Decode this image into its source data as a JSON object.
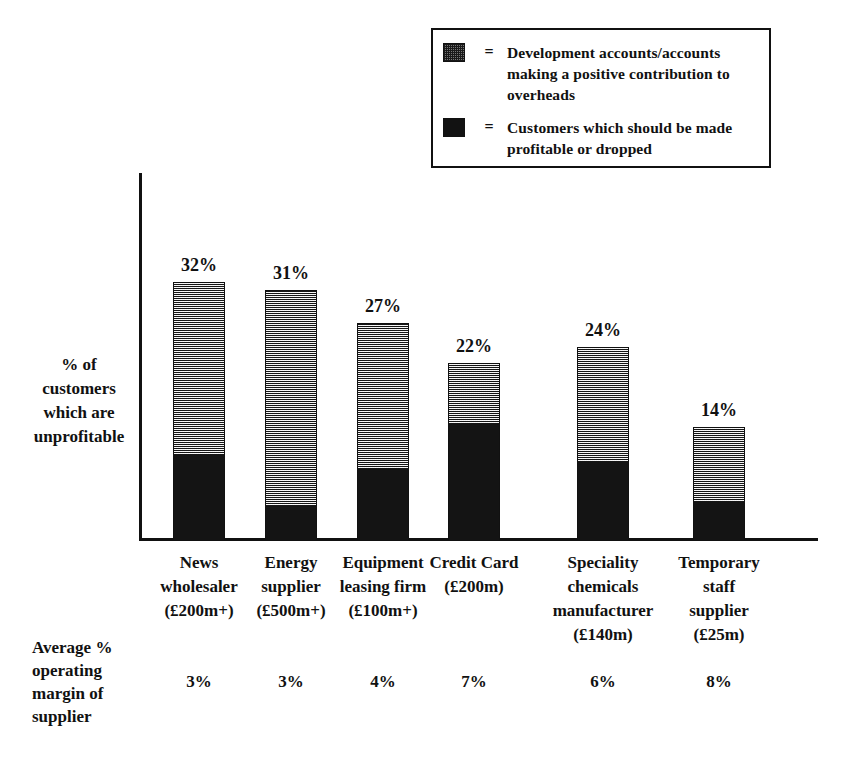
{
  "legend": {
    "items": [
      {
        "swatch": "stipple-pattern-swatch",
        "equals": "=",
        "label": "Development accounts/accounts making a positive contribution to overheads"
      },
      {
        "swatch": "solid-black-swatch",
        "equals": "=",
        "label": "Customers which should be made profitable or dropped"
      }
    ]
  },
  "axes": {
    "y_title": "% of customers which are unprofitable",
    "margin_row_title": "Average % operating margin of supplier"
  },
  "chart_data": {
    "type": "bar",
    "title": "",
    "subtitle": "",
    "xlabel": "",
    "ylabel": "% of customers which are unprofitable",
    "ylim": [
      0,
      35
    ],
    "grid": false,
    "legend_position": "top-right",
    "stacked": true,
    "categories": [
      "News wholesaler (£200m+)",
      "Energy supplier (£500m+)",
      "Equipment leasing firm (£100m+)",
      "Credit Card (£200m)",
      "Speciality chemicals manufacturer (£140m)",
      "Temporary staff supplier (£25m)"
    ],
    "category_lines": [
      [
        "News",
        "wholesaler",
        "(£200m+)"
      ],
      [
        "Energy",
        "supplier",
        "(£500m+)"
      ],
      [
        "Equipment",
        "leasing firm",
        "(£100m+)"
      ],
      [
        "Credit Card",
        "(£200m)"
      ],
      [
        "Speciality",
        "chemicals",
        "manufacturer",
        "(£140m)"
      ],
      [
        "Temporary",
        "staff",
        "supplier",
        "(£25m)"
      ]
    ],
    "values": [
      32,
      31,
      27,
      22,
      24,
      14
    ],
    "value_labels": [
      "32%",
      "31%",
      "27%",
      "22%",
      "24%",
      "14%"
    ],
    "series": [
      {
        "name": "Development accounts/accounts making a positive contribution to overheads",
        "pattern": "stipple",
        "values": [
          21.4,
          26.7,
          18.1,
          7.5,
          14.2,
          9.2
        ]
      },
      {
        "name": "Customers which should be made profitable or dropped",
        "pattern": "solid",
        "values": [
          10.6,
          4.3,
          8.9,
          14.5,
          9.8,
          4.8
        ]
      }
    ],
    "secondary_row": {
      "label": "Average % operating margin of supplier",
      "values": [
        "3%",
        "3%",
        "4%",
        "7%",
        "6%",
        "8%"
      ]
    }
  }
}
